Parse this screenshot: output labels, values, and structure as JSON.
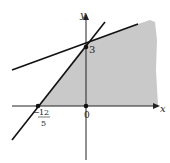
{
  "diagram": {
    "type": "linear-inequality-region",
    "axes": {
      "x_label": "x",
      "y_label": "y"
    },
    "points": [
      {
        "name": "y-intercept",
        "label": "3",
        "coords": [
          0,
          3
        ]
      },
      {
        "name": "origin",
        "label": "0",
        "coords": [
          0,
          0
        ]
      },
      {
        "name": "x-intercept",
        "label_num": "12",
        "label_den": "5",
        "label_sign": "−",
        "coords": [
          -2.4,
          0
        ]
      }
    ],
    "lines": [
      {
        "name": "steep-line",
        "through": [
          [
            -2.4,
            0
          ],
          [
            0,
            3
          ]
        ]
      },
      {
        "name": "shallow-line",
        "through": "passes near (0,3)"
      }
    ],
    "region": {
      "fill": "#c8c8c8",
      "description": "shaded feasible region right of steep line, above x-axis"
    }
  }
}
